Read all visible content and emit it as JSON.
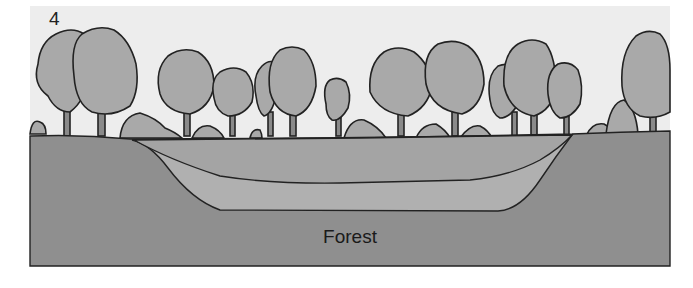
{
  "figure": {
    "panel_number": "4",
    "stage_label": "Forest",
    "colors": {
      "sky": "#ededed",
      "ground": "#8f8f8f",
      "basin_upper": "#a4a4a4",
      "basin_lower": "#b0b0b0",
      "tree_canopy": "#a9a9a9",
      "outline": "#222222"
    }
  }
}
